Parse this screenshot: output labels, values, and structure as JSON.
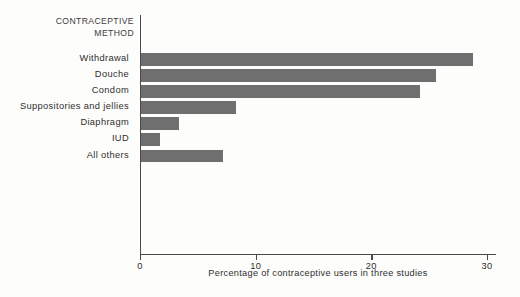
{
  "chart_data": {
    "type": "bar",
    "orientation": "horizontal",
    "title": "",
    "axis_title": "CONTRACEPTIVE\nMETHOD",
    "categories": [
      "Withdrawal",
      "Douche",
      "Condom",
      "Suppositories and jellies",
      "Diaphragm",
      "IUD",
      "All others"
    ],
    "values": [
      28.7,
      25.5,
      24.1,
      8.2,
      3.3,
      1.6,
      7.1
    ],
    "xlabel": "Percentage of contraceptive users in three studies",
    "ylabel": "CONTRACEPTIVE METHOD",
    "xlim": [
      0,
      30
    ],
    "xticks": [
      0,
      10,
      20,
      30
    ],
    "xtick_labels": [
      "0",
      "10",
      "20",
      "30"
    ],
    "grid": false,
    "legend": false,
    "bar_color": "#6f6f6f",
    "axis_color": "#4a4a4a",
    "background_color": "#fdfdfc"
  }
}
